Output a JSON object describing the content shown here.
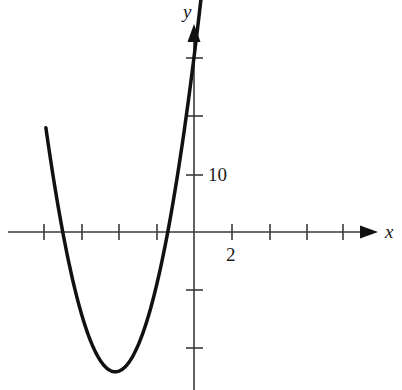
{
  "figure": {
    "background_color": "#ffffff",
    "ink_color": "#111111",
    "curve_color": "#111111",
    "axis_color": "#3a3a3a"
  },
  "axes": {
    "x_axis_label": "x",
    "y_axis_label": "y",
    "x_tick_label": "2",
    "y_tick_label": "10",
    "origin_px": {
      "x": 194,
      "y": 232
    },
    "x_tick_spacing_px": 37.5,
    "y_tick_spacing_px": 58,
    "x_units_per_tick": 2,
    "y_units_per_tick": 10,
    "x_tick_positions_px": [
      44,
      82,
      119,
      157,
      232,
      270,
      307,
      343
    ],
    "y_tick_positions_px": [
      58,
      116,
      175,
      290,
      348
    ],
    "x_axis_start_px": 8,
    "x_axis_end_px": 372,
    "y_axis_top_px": 28,
    "y_axis_bottom_px": 390,
    "arrow_heads": [
      "x-axis-right",
      "y-axis-top"
    ]
  },
  "chart_data": {
    "type": "line",
    "title": "",
    "xlabel": "x",
    "ylabel": "y",
    "grid": false,
    "legend": null,
    "xlim": [
      -8.0,
      9.5
    ],
    "ylim": [
      -27.2,
      30.0
    ],
    "xticks": [
      -8,
      -6,
      -4,
      -2,
      2,
      4,
      6,
      8
    ],
    "xtick_labels": [
      "",
      "",
      "",
      "",
      "2",
      "",
      "",
      ""
    ],
    "yticks": [
      -20,
      -10,
      10,
      20,
      30
    ],
    "ytick_labels": [
      "",
      "",
      "10",
      "",
      ""
    ],
    "annotations": [
      {
        "text": "10",
        "x": 0.55,
        "y": 10
      },
      {
        "text": "2",
        "x": 2,
        "y": -4.2
      }
    ],
    "series": [
      {
        "name": "parabola",
        "equation": "y = 2.08*(x + 4.2)^2 - 24.1",
        "vertex": {
          "x": -4.2,
          "y": -24.1
        },
        "x_intercepts": [
          -7.0,
          -1.4
        ],
        "x_range": [
          -7.9,
          0.45
        ],
        "x": [
          -7.9,
          -7.5,
          -7.0,
          -6.5,
          -6.0,
          -5.5,
          -5.0,
          -4.5,
          -4.2,
          -4.0,
          -3.5,
          -3.0,
          -2.5,
          -2.0,
          -1.5,
          -1.4,
          -1.0,
          -0.5,
          0.0,
          0.25,
          0.45
        ],
        "y": [
          20.3,
          12.5,
          3.6,
          -4.3,
          -11.4,
          -17.0,
          -20.8,
          -23.9,
          -24.1,
          -23.3,
          -21.0,
          -17.1,
          -11.7,
          -14.8,
          0.2,
          -0.1,
          6.3,
          14.6,
          12.6,
          19.0,
          31.2
        ]
      }
    ]
  }
}
